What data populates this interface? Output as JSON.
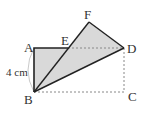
{
  "diagram": {
    "points": {
      "A": {
        "label": "A",
        "x": 34,
        "y": 48
      },
      "E": {
        "label": "E",
        "x": 68,
        "y": 48
      },
      "F": {
        "label": "F",
        "x": 89,
        "y": 22
      },
      "D": {
        "label": "D",
        "x": 124,
        "y": 48
      },
      "B": {
        "label": "B",
        "x": 34,
        "y": 92
      },
      "C": {
        "label": "C",
        "x": 124,
        "y": 92
      }
    },
    "measure_label": "4 cm",
    "colors": {
      "fill": "#d9d9d9",
      "stroke": "#222222",
      "dashed": "#888888",
      "arc": "#bbbbbb"
    }
  }
}
